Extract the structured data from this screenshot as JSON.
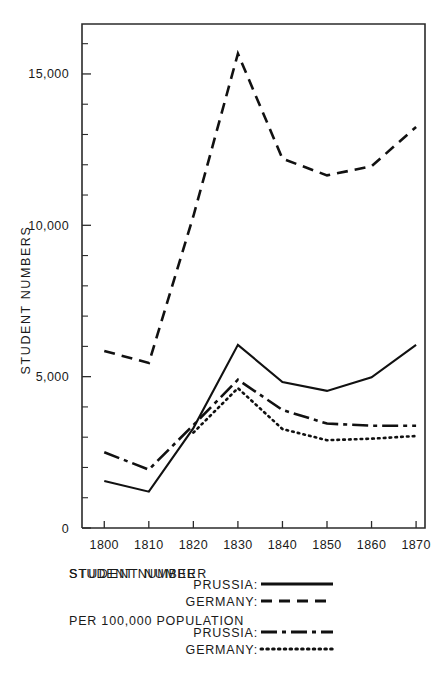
{
  "chart_data": {
    "type": "line",
    "title": "",
    "xlabel": "STUDENT NUMBER",
    "ylabel": "STUDENT NUMBERS",
    "x": [
      1800,
      1810,
      1820,
      1830,
      1840,
      1850,
      1860,
      1870
    ],
    "xtick_labels": [
      "1800",
      "1810",
      "1820",
      "1830",
      "1840",
      "1850",
      "1860",
      "1870"
    ],
    "xlim": [
      1795,
      1872
    ],
    "ylim": [
      0,
      16650
    ],
    "ytick_labels": [
      "0",
      "5,000",
      "10,000",
      "15,000"
    ],
    "ytick_values": [
      0,
      5000,
      10000,
      15000
    ],
    "yminor_step": 1000,
    "grid": false,
    "legend_position": "below-axes",
    "series": [
      {
        "name": "PRUSSIA:",
        "group": "STUDENT NUMBER",
        "style": "solid",
        "color": "#111111",
        "values": [
          1550,
          1200,
          3300,
          6050,
          4820,
          4530,
          4980,
          6050
        ]
      },
      {
        "name": "GERMANY:",
        "group": "STUDENT NUMBER",
        "style": "dashed",
        "color": "#111111",
        "values": [
          5850,
          5450,
          10300,
          15670,
          12200,
          11650,
          11950,
          13250
        ]
      },
      {
        "name": "PRUSSIA:",
        "group": "PER 100,000 POPULATION",
        "style": "dash-dot",
        "color": "#111111",
        "values": [
          2500,
          1930,
          3400,
          4900,
          3900,
          3450,
          3380,
          3380
        ]
      },
      {
        "name": "GERMANY:",
        "group": "PER 100,000 POPULATION",
        "style": "dotted",
        "color": "#111111",
        "values": [
          null,
          null,
          3150,
          4620,
          3270,
          2900,
          2950,
          3040
        ]
      }
    ]
  },
  "legend": {
    "group_1_title": "STUDENT NUMBER",
    "group_1_entries": [
      {
        "label": "PRUSSIA:",
        "style": "solid"
      },
      {
        "label": "GERMANY:",
        "style": "dashed"
      }
    ],
    "group_2_title": "PER 100,000 POPULATION",
    "group_2_entries": [
      {
        "label": "PRUSSIA:",
        "style": "dash-dot"
      },
      {
        "label": "GERMANY:",
        "style": "dotted"
      }
    ]
  }
}
